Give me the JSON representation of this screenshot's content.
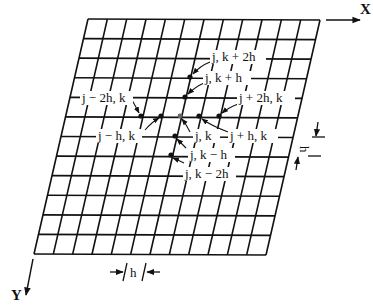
{
  "figure": {
    "type": "finite-difference-grid",
    "grid": {
      "columns": 12,
      "rows": 12,
      "color": "#111111"
    },
    "axes": {
      "x_label": "X",
      "y_label": "Y"
    },
    "spacing": {
      "horizontal_label": "h",
      "vertical_label": "h"
    },
    "nodes": [
      {
        "id": "center",
        "label": "j, k"
      },
      {
        "id": "k_plus_h",
        "label": "j, k + h"
      },
      {
        "id": "k_plus_2h",
        "label": "j, k + 2h"
      },
      {
        "id": "k_minus_h",
        "label": "j, k − h"
      },
      {
        "id": "k_minus_2h",
        "label": "j, k − 2h"
      },
      {
        "id": "j_minus_h",
        "label": "j − h, k"
      },
      {
        "id": "j_minus_2h",
        "label": "j − 2h, k"
      },
      {
        "id": "j_plus_h",
        "label": "j + h, k"
      },
      {
        "id": "j_plus_2h",
        "label": "j + 2h, k"
      }
    ]
  }
}
